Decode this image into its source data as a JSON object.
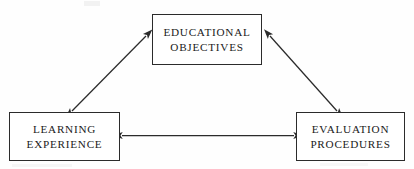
{
  "diagram": {
    "type": "triangular-relationship-diagram",
    "background_color": "#fefefe",
    "stroke_color": "#2b2b2b",
    "text_color": "#1a1a1a",
    "nodes": [
      {
        "id": "educational-objectives",
        "lines": [
          "EDUCATIONAL",
          "OBJECTIVES"
        ],
        "line1": "EDUCATIONAL",
        "line2": "OBJECTIVES",
        "position": "top-center"
      },
      {
        "id": "learning-experience",
        "lines": [
          "LEARNING",
          "EXPERIENCE"
        ],
        "line1": "LEARNING",
        "line2": "EXPERIENCE",
        "position": "bottom-left"
      },
      {
        "id": "evaluation-procedures",
        "lines": [
          "EVALUATION",
          "PROCEDURES"
        ],
        "line1": "EVALUATION",
        "line2": "PROCEDURES",
        "position": "bottom-right"
      }
    ],
    "connectors": [
      {
        "id": "objectives-learning-connector",
        "from": "educational-objectives",
        "to": "learning-experience",
        "style": "double-headed-arrow",
        "orientation": "diagonal-left"
      },
      {
        "id": "objectives-evaluation-connector",
        "from": "educational-objectives",
        "to": "evaluation-procedures",
        "style": "double-headed-arrow",
        "orientation": "diagonal-right"
      },
      {
        "id": "learning-evaluation-connector",
        "from": "learning-experience",
        "to": "evaluation-procedures",
        "style": "double-headed-arrow",
        "orientation": "horizontal"
      }
    ]
  }
}
